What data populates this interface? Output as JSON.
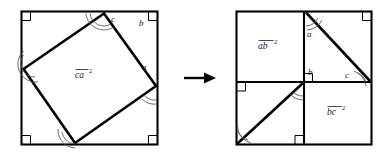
{
  "figure": {
    "stroke_color": "#000000",
    "background_color": "#ffffff",
    "arc_color": "#555555"
  },
  "transform_arrow": {
    "glyph_name": "right-arrow-icon",
    "direction": "right"
  },
  "left_panel": {
    "name": "tilted-square-in-square",
    "area_label": {
      "base": "ca",
      "exponent": "2",
      "overline": true
    },
    "side_labels": [
      {
        "key": "c",
        "text": "c"
      },
      {
        "key": "b",
        "text": "b"
      },
      {
        "key": "a",
        "text": "a"
      }
    ],
    "right_angle_marks": 4,
    "angle_arcs": 4
  },
  "right_panel": {
    "name": "two-squares-rearrangement",
    "area_labels": [
      {
        "base": "ab",
        "exponent": "2",
        "overline": true
      },
      {
        "base": "bc",
        "exponent": "2",
        "overline": true
      }
    ],
    "side_labels": [
      {
        "key": "a",
        "text": "a"
      },
      {
        "key": "b",
        "text": "b"
      },
      {
        "key": "c",
        "text": "c"
      }
    ],
    "right_angle_marks": 4,
    "angle_arcs": 4
  }
}
